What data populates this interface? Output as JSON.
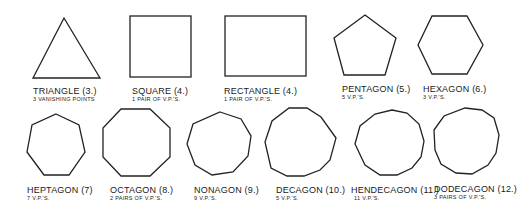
{
  "shapes": [
    {
      "name": "TRIANGLE",
      "sides": "(3.)",
      "note": "3 VANISHING POINTS"
    },
    {
      "name": "SQUARE",
      "sides": "(4.)",
      "note": "1 PAIR OF V.P.'S."
    },
    {
      "name": "RECTANGLE",
      "sides": "(4.)",
      "note": "1 PAIR OF V.P.'S."
    },
    {
      "name": "PENTAGON",
      "sides": "(5.)",
      "note": "5 V.P.'S."
    },
    {
      "name": "HEXAGON",
      "sides": "(6.)",
      "note": "3 V.P.'S."
    },
    {
      "name": "HEPTAGON",
      "sides": "(7)",
      "note": "7 V.P.'S."
    },
    {
      "name": "OCTAGON",
      "sides": "(8.)",
      "note": "2 PAIRS OF V.P.'S."
    },
    {
      "name": "NONAGON",
      "sides": "(9.)",
      "note": "9 V.P.'S."
    },
    {
      "name": "DECAGON",
      "sides": "(10.)",
      "note": "5 V.P.'S."
    },
    {
      "name": "HENDECAGON",
      "sides": "(11.)",
      "note": "11 V.P.'S."
    },
    {
      "name": "DODECAGON",
      "sides": "(12.)",
      "note": "3 PAIRS OF V.P.'S."
    }
  ]
}
